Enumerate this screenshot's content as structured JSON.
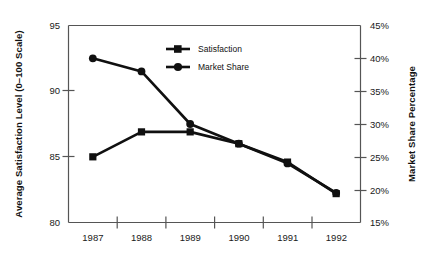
{
  "chart_data": {
    "type": "line",
    "title": "",
    "subtitle": "",
    "xlabel": "",
    "categories": [
      "1987",
      "1988",
      "1989",
      "1990",
      "1991",
      "1992"
    ],
    "grid": false,
    "legend_position": "inside-top-center",
    "axes": {
      "left": {
        "label": "Average Satisfaction Level (0–100 Scale)",
        "ticks": [
          "80",
          "85",
          "90",
          "95"
        ],
        "tick_values": [
          80,
          85,
          90,
          95
        ],
        "ylim": [
          80,
          95
        ]
      },
      "right": {
        "label": "Market Share Percentage",
        "ticks": [
          "15%",
          "20%",
          "25%",
          "30%",
          "35%",
          "40%",
          "45%"
        ],
        "tick_values": [
          15,
          20,
          25,
          30,
          35,
          40,
          45
        ],
        "ylim": [
          15,
          45
        ]
      }
    },
    "series": [
      {
        "name": "Satisfaction",
        "axis": "left",
        "marker": "square",
        "color": "#101010",
        "values": [
          85.0,
          86.9,
          86.9,
          86.0,
          84.6,
          82.2
        ]
      },
      {
        "name": "Market Share",
        "axis": "right",
        "marker": "circle",
        "color": "#101010",
        "values": [
          40.0,
          38.0,
          30.0,
          27.0,
          24.0,
          19.5
        ]
      }
    ]
  },
  "legend": {
    "items": [
      {
        "label": "Satisfaction",
        "marker": "square"
      },
      {
        "label": "Market Share",
        "marker": "circle"
      }
    ]
  },
  "colors": {
    "series": "#101010",
    "axis": "#555555",
    "text": "#1a1a1a",
    "background": "#ffffff"
  }
}
